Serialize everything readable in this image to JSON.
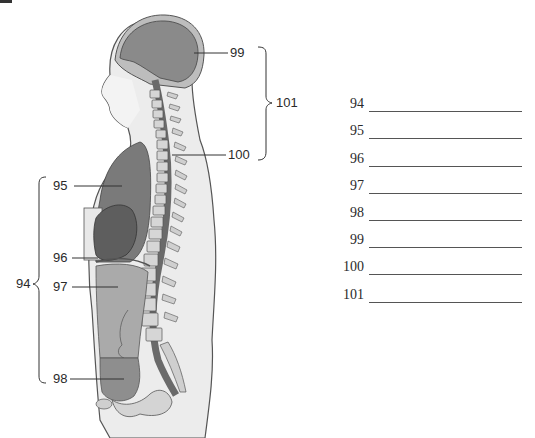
{
  "figure": {
    "callouts": [
      {
        "id": "95",
        "label": "95"
      },
      {
        "id": "96",
        "label": "96"
      },
      {
        "id": "97",
        "label": "97"
      },
      {
        "id": "98",
        "label": "98"
      },
      {
        "id": "99",
        "label": "99"
      },
      {
        "id": "100",
        "label": "100"
      }
    ],
    "brackets": [
      {
        "id": "94",
        "label": "94"
      },
      {
        "id": "101",
        "label": "101"
      }
    ]
  },
  "answers": [
    {
      "number": "94",
      "value": ""
    },
    {
      "number": "95",
      "value": ""
    },
    {
      "number": "96",
      "value": ""
    },
    {
      "number": "97",
      "value": ""
    },
    {
      "number": "98",
      "value": ""
    },
    {
      "number": "99",
      "value": ""
    },
    {
      "number": "100",
      "value": ""
    },
    {
      "number": "101",
      "value": ""
    }
  ],
  "colors": {
    "organ_dark": "#6e6e6e",
    "organ_mid": "#8c8c8c",
    "body_light": "#e4e4e4",
    "outline": "#4a4a4a"
  }
}
